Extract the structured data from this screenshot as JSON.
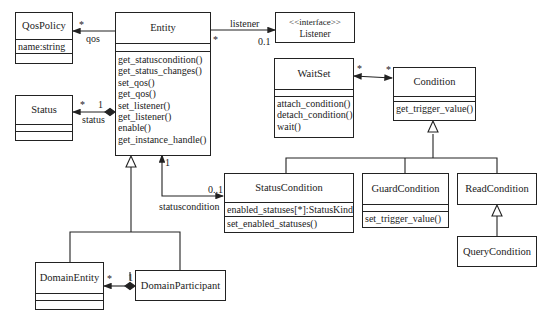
{
  "classes": {
    "qos_policy": {
      "name": "QosPolicy",
      "attributes": [
        "name:string"
      ],
      "operations": []
    },
    "entity": {
      "name": "Entity",
      "attributes": [],
      "operations": [
        "get_statuscondition()",
        "get_status_changes()",
        "set_qos()",
        "get_qos()",
        "set_listener()",
        "get_listener()",
        "enable()",
        "get_instance_handle()"
      ]
    },
    "listener": {
      "stereotype": "<<interface>>",
      "name": "Listener"
    },
    "status": {
      "name": "Status",
      "attributes": [],
      "operations": []
    },
    "waitset": {
      "name": "WaitSet",
      "attributes": [],
      "operations": [
        "attach_condition()",
        "detach_condition()",
        "wait()"
      ]
    },
    "condition": {
      "name": "Condition",
      "attributes": [],
      "operations": [
        "get_trigger_value()"
      ]
    },
    "status_condition": {
      "name": "StatusCondition",
      "attributes": [
        "enabled_statuses[*]:StatusKind"
      ],
      "operations": [
        "set_enabled_statuses()"
      ]
    },
    "guard_condition": {
      "name": "GuardCondition",
      "attributes": [],
      "operations": [
        "set_trigger_value()"
      ]
    },
    "read_condition": {
      "name": "ReadCondition"
    },
    "query_condition": {
      "name": "QueryCondition"
    },
    "domain_entity": {
      "name": "DomainEntity",
      "attributes": [],
      "operations": []
    },
    "domain_participant": {
      "name": "DomainParticipant"
    }
  },
  "associations": {
    "qos": {
      "role": "qos",
      "mult": "*"
    },
    "listener": {
      "role": "listener",
      "mult_source": "*",
      "mult_target": "0.1"
    },
    "status": {
      "role": "status",
      "mult_target": "*",
      "mult_source": "1"
    },
    "waitset_condition": {
      "mult_left": "*",
      "mult_right": "*"
    },
    "statuscondition": {
      "role": "statuscondition",
      "mult_source": "1",
      "mult_target": "0..1"
    },
    "domain": {
      "mult_left": "*",
      "mult_right": "1"
    }
  }
}
